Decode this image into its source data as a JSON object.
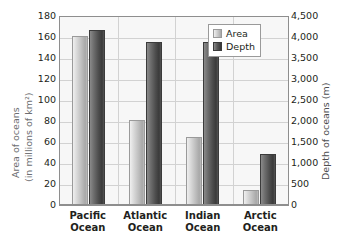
{
  "chart_data": {
    "type": "bar",
    "title": "",
    "categories": [
      "Pacific Ocean",
      "Atlantic Ocean",
      "Indian Ocean",
      "Arctic Ocean"
    ],
    "series": [
      {
        "name": "Area",
        "axis": "left",
        "unit": "millions of km²",
        "values": [
          162,
          81,
          65,
          14
        ]
      },
      {
        "name": "Depth",
        "axis": "right",
        "unit": "m",
        "values": [
          4200,
          3900,
          3900,
          1225
        ]
      }
    ],
    "left_axis": {
      "label_line1": "Area of oceans",
      "label_line2": "(in millions of km²)",
      "ylim": [
        0,
        180
      ],
      "step": 20,
      "ticks": [
        "180",
        "160",
        "140",
        "120",
        "100",
        "80",
        "60",
        "40",
        "20",
        "0"
      ]
    },
    "right_axis": {
      "label": "Depth of oceans (m)",
      "ylim": [
        0,
        4500
      ],
      "step": 500,
      "ticks": [
        "4,500",
        "4,000",
        "3,500",
        "3,000",
        "2,500",
        "2,000",
        "1,500",
        "1,000",
        "500",
        "0"
      ]
    },
    "xlabel": "",
    "grid": true,
    "legend": {
      "position": "top-right",
      "entries": [
        {
          "label": "Area",
          "color": "#c8c8c8"
        },
        {
          "label": "Depth",
          "color": "#4e4e4e"
        }
      ]
    }
  },
  "colors": {
    "area_bar": "#c8c8c8",
    "depth_bar": "#4e4e4e",
    "plot_background": "#f7f7f7",
    "gridline": "#d2d2d2",
    "frame": "#8e8e8e",
    "axis_title_text": "#6d6e71",
    "tick_text": "#231f20"
  }
}
